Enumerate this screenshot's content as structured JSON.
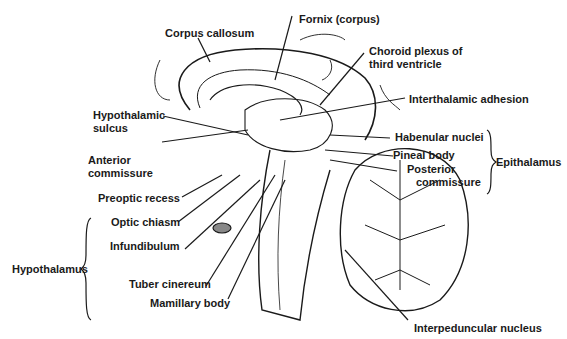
{
  "diagram": {
    "labels": {
      "corpus_callosum": "Corpus callosum",
      "fornix": "Fornix (corpus)",
      "choroid_1": "Choroid plexus of",
      "choroid_2": "third ventricle",
      "interthalamic": "Interthalamic adhesion",
      "hypothalamic_sulcus_1": "Hypothalamic",
      "hypothalamic_sulcus_2": "sulcus",
      "habenular": "Habenular nuclei",
      "anterior_commissure_1": "Anterior",
      "anterior_commissure_2": "commissure",
      "pineal": "Pineal body",
      "posterior_commissure_1": "Posterior",
      "posterior_commissure_2": "commissure",
      "epithalamus": "Epithalamus",
      "preoptic": "Preoptic recess",
      "optic_chiasm": "Optic chiasm",
      "infundibulum": "Infundibulum",
      "hypothalamus": "Hypothalamus",
      "tuber_cinereum": "Tuber cinereum",
      "mamillary": "Mamillary body",
      "interpeduncular": "Interpeduncular nucleus"
    },
    "groups": [
      {
        "name": "Epithalamus",
        "members": [
          "Habenular nuclei",
          "Pineal body",
          "Posterior commissure"
        ]
      },
      {
        "name": "Hypothalamus",
        "members": [
          "Optic chiasm",
          "Infundibulum",
          "Tuber cinereum",
          "Mamillary body"
        ]
      }
    ]
  }
}
